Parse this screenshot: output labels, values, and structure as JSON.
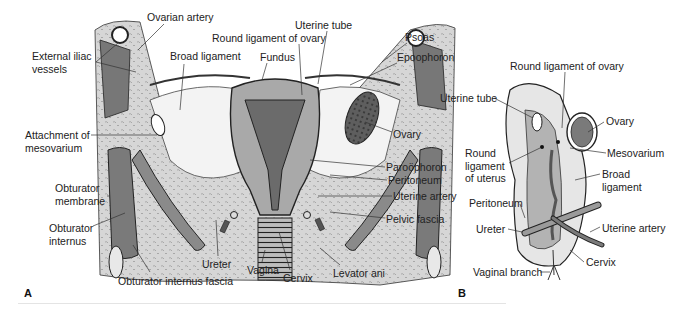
{
  "figure": {
    "panels": [
      {
        "id": "A",
        "label": "A",
        "labels": [
          {
            "text": "Ovarian artery",
            "x": 147,
            "y": 18
          },
          {
            "text": "External iliac",
            "x": 32,
            "y": 57
          },
          {
            "text": "vessels",
            "x": 32,
            "y": 69
          },
          {
            "text": "Broad ligament",
            "x": 170,
            "y": 57
          },
          {
            "text": "Round ligament of ovary",
            "x": 212,
            "y": 38
          },
          {
            "text": "Uterine tube",
            "x": 295,
            "y": 25
          },
          {
            "text": "Fundus",
            "x": 260,
            "y": 57
          },
          {
            "text": "Psoas",
            "x": 405,
            "y": 37
          },
          {
            "text": "Epoophoron",
            "x": 397,
            "y": 57
          },
          {
            "text": "Attachment of",
            "x": 25,
            "y": 129
          },
          {
            "text": "mesovarium",
            "x": 25,
            "y": 142
          },
          {
            "text": "Ovary",
            "x": 393,
            "y": 128
          },
          {
            "text": "Paroöphoron",
            "x": 386,
            "y": 163
          },
          {
            "text": "Peritoneum",
            "x": 388,
            "y": 176
          },
          {
            "text": "Uterine artery",
            "x": 393,
            "y": 192
          },
          {
            "text": "Obturator",
            "x": 55,
            "y": 181
          },
          {
            "text": "membrane",
            "x": 55,
            "y": 194
          },
          {
            "text": "Obturator",
            "x": 49,
            "y": 223
          },
          {
            "text": "internus",
            "x": 49,
            "y": 236
          },
          {
            "text": "Pelvic fascia",
            "x": 386,
            "y": 214
          },
          {
            "text": "Ureter",
            "x": 202,
            "y": 259
          },
          {
            "text": "Vagina",
            "x": 247,
            "y": 266
          },
          {
            "text": "Cervix",
            "x": 283,
            "y": 274
          },
          {
            "text": "Levator ani",
            "x": 333,
            "y": 268
          },
          {
            "text": "Obturator internus fascia",
            "x": 118,
            "y": 276
          }
        ]
      },
      {
        "id": "B",
        "label": "B",
        "labels": [
          {
            "text": "Round ligament of ovary",
            "x": 510,
            "y": 61
          },
          {
            "text": "Uterine tube",
            "x": 440,
            "y": 93
          },
          {
            "text": "Ovary",
            "x": 606,
            "y": 116
          },
          {
            "text": "Round",
            "x": 465,
            "y": 147
          },
          {
            "text": "ligament",
            "x": 465,
            "y": 160
          },
          {
            "text": "of uterus",
            "x": 465,
            "y": 172
          },
          {
            "text": "Mesovarium",
            "x": 607,
            "y": 148
          },
          {
            "text": "Broad",
            "x": 602,
            "y": 168
          },
          {
            "text": "ligament",
            "x": 602,
            "y": 181
          },
          {
            "text": "Peritoneum",
            "x": 469,
            "y": 197
          },
          {
            "text": "Ureter",
            "x": 476,
            "y": 224
          },
          {
            "text": "Uterine artery",
            "x": 602,
            "y": 222
          },
          {
            "text": "Cervix",
            "x": 586,
            "y": 258
          },
          {
            "text": "Vaginal branch",
            "x": 473,
            "y": 268
          }
        ]
      }
    ],
    "colors": {
      "outline": "#222222",
      "muscle_dark": "#6e6e6e",
      "muscle_mid": "#9a9a9a",
      "tissue_light": "#d9d9d9",
      "fascia_stipple": "#c8c8c8",
      "ligament": "#f2f2f2",
      "label_text": "#222222"
    }
  }
}
